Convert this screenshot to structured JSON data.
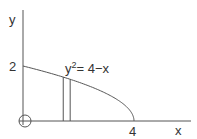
{
  "diagram": {
    "type": "region-under-curve",
    "curve": {
      "equation_base": "y",
      "equation_exp": "2",
      "equation_rest": "= 4−x",
      "x_intercept": 4,
      "y_intercept": 2
    },
    "axes": {
      "x_label": "x",
      "y_label": "y"
    },
    "ticks": {
      "x": "4",
      "y": "2"
    },
    "strip": {
      "x_from": 1.45,
      "x_to": 1.7
    },
    "origin_marker": "circle",
    "colors": {
      "line": "#555555",
      "text": "#333333",
      "background": "#ffffff"
    }
  }
}
